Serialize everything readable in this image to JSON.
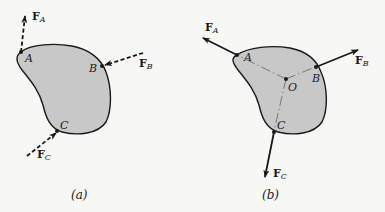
{
  "colors": {
    "body_fill": "#c8c8c8",
    "outline": "#1a1a1a",
    "background": "#f7f7f5"
  },
  "diagram_a": {
    "caption": "(a)",
    "points": [
      {
        "name": "A",
        "label": "A"
      },
      {
        "name": "B",
        "label": "B"
      },
      {
        "name": "C",
        "label": "C"
      }
    ],
    "forces": [
      {
        "name": "F_A",
        "symbol": "F",
        "subscript": "A",
        "style": "dashed"
      },
      {
        "name": "F_B",
        "symbol": "F",
        "subscript": "B",
        "style": "dashed"
      },
      {
        "name": "F_C",
        "symbol": "F",
        "subscript": "C",
        "style": "dashed"
      }
    ]
  },
  "diagram_b": {
    "caption": "(b)",
    "points": [
      {
        "name": "A",
        "label": "A"
      },
      {
        "name": "B",
        "label": "B"
      },
      {
        "name": "C",
        "label": "C"
      },
      {
        "name": "O",
        "label": "O"
      }
    ],
    "forces": [
      {
        "name": "F_A",
        "symbol": "F",
        "subscript": "A",
        "style": "solid"
      },
      {
        "name": "F_B",
        "symbol": "F",
        "subscript": "B",
        "style": "solid"
      },
      {
        "name": "F_C",
        "symbol": "F",
        "subscript": "C",
        "style": "solid"
      }
    ]
  }
}
